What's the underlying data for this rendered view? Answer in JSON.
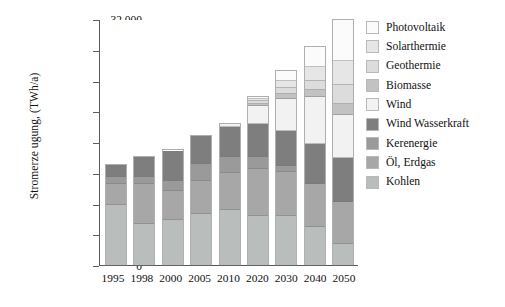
{
  "chart_data": {
    "type": "bar",
    "subtype": "stacked-bar",
    "title": "",
    "xlabel": "",
    "ylabel": "Stromerze ugung, (TWh/a)",
    "ylim": [
      0,
      32000
    ],
    "ytick_labels": [
      "32.000",
      "28.000",
      "24.000",
      "20.000",
      "16.000",
      "12.000",
      "8.000",
      "4.000",
      "0"
    ],
    "ytick_values": [
      32000,
      28000,
      24000,
      20000,
      16000,
      12000,
      8000,
      4000,
      0
    ],
    "grid": false,
    "legend_position": "right",
    "categories": [
      "1995",
      "1998",
      "2000",
      "2005",
      "2010",
      "2020",
      "2030",
      "2040",
      "2050"
    ],
    "series": [
      {
        "name": "Kohlen",
        "color": "#b9bdbb",
        "values": [
          7800,
          5400,
          5900,
          6700,
          7100,
          6400,
          6400,
          4900,
          2700
        ]
      },
      {
        "name": "Öl, Erdgas",
        "color": "#a7a7a7",
        "values": [
          2700,
          5100,
          3700,
          4200,
          4900,
          6100,
          5700,
          5600,
          5500
        ]
      },
      {
        "name": "Kerenergie",
        "color": "#9a9a9a",
        "values": [
          900,
          1000,
          1300,
          2200,
          2000,
          1600,
          800,
          0,
          0
        ]
      },
      {
        "name": "Wind Wasserkraft",
        "color": "#7e7e7e",
        "values": [
          1600,
          2600,
          4000,
          3700,
          4000,
          4200,
          4500,
          5200,
          5800
        ]
      },
      {
        "name": "Wind",
        "color": "#f2f2f2",
        "values": [
          0,
          0,
          0,
          0,
          400,
          2400,
          4200,
          6100,
          5600
        ]
      },
      {
        "name": "Biomasse",
        "color": "#c2c2c2",
        "values": [
          0,
          0,
          0,
          0,
          0,
          300,
          700,
          1000,
          1400
        ]
      },
      {
        "name": "Geothermie",
        "color": "#dcdcdc",
        "values": [
          0,
          0,
          0,
          0,
          0,
          300,
          700,
          1200,
          2500
        ]
      },
      {
        "name": "Solarthermie",
        "color": "#e6e6e6",
        "values": [
          0,
          0,
          0,
          0,
          0,
          300,
          900,
          1700,
          3200
        ]
      },
      {
        "name": "Photovoltaik",
        "color": "#fbfbfb",
        "values": [
          0,
          0,
          0,
          0,
          0,
          300,
          1400,
          2700,
          5300
        ]
      }
    ],
    "totals": [
      13000,
      14100,
      14900,
      16800,
      18400,
      21900,
      25300,
      28400,
      32000
    ]
  },
  "legend": {
    "items": [
      {
        "label": "Photovoltaik",
        "color": "#fbfbfb"
      },
      {
        "label": "Solarthermie",
        "color": "#e6e6e6"
      },
      {
        "label": "Geothermie",
        "color": "#dcdcdc"
      },
      {
        "label": "Biomasse",
        "color": "#c2c2c2"
      },
      {
        "label": "Wind",
        "color": "#f2f2f2"
      },
      {
        "label": "Wind Wasserkraft",
        "color": "#7e7e7e"
      },
      {
        "label": "Kerenergie",
        "color": "#9a9a9a"
      },
      {
        "label": "Öl, Erdgas",
        "color": "#a7a7a7"
      },
      {
        "label": "Kohlen",
        "color": "#b9bdbb"
      }
    ]
  },
  "axis": {
    "line_color": "#5a5a5a",
    "background": "#ffffff"
  }
}
